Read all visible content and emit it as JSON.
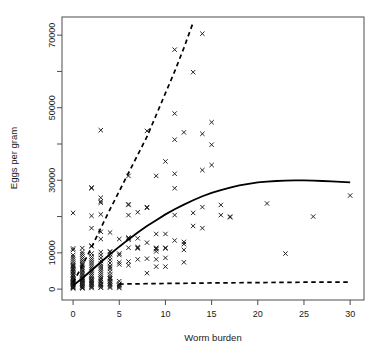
{
  "chart_data": {
    "type": "scatter",
    "title": "",
    "xlabel": "Worm burden",
    "ylabel": "Eggs per gram",
    "xlim": [
      -1.2,
      31.5
    ],
    "ylim": [
      -3000,
      75000
    ],
    "grid": false,
    "legend": "none",
    "marker": "x-cross",
    "xticks": [
      0,
      5,
      10,
      15,
      20,
      25,
      30
    ],
    "xtick_labels": [
      "0",
      "5",
      "10",
      "15",
      "20",
      "25",
      "30"
    ],
    "yticks": [
      0,
      10000,
      20000,
      30000,
      40000,
      50000,
      60000,
      70000
    ],
    "ytick_labels": [
      "0",
      "10000",
      "",
      "30000",
      "",
      "50000",
      "",
      "70000"
    ],
    "ytick_labeled": [
      0,
      10000,
      30000,
      50000,
      70000
    ],
    "points": [
      [
        0,
        200
      ],
      [
        0,
        400
      ],
      [
        0,
        600
      ],
      [
        0,
        800
      ],
      [
        0,
        1000
      ],
      [
        0,
        1200
      ],
      [
        0,
        1400
      ],
      [
        0,
        1600
      ],
      [
        0,
        1800
      ],
      [
        0,
        2000
      ],
      [
        0,
        2200
      ],
      [
        0,
        2400
      ],
      [
        0,
        2600
      ],
      [
        0,
        3000
      ],
      [
        0,
        3400
      ],
      [
        0,
        3800
      ],
      [
        0,
        4200
      ],
      [
        0,
        4600
      ],
      [
        0,
        5000
      ],
      [
        0,
        5400
      ],
      [
        0,
        5800
      ],
      [
        0,
        6200
      ],
      [
        0,
        6600
      ],
      [
        0,
        7000
      ],
      [
        0,
        7600
      ],
      [
        0,
        8200
      ],
      [
        0,
        8800
      ],
      [
        0,
        9400
      ],
      [
        0,
        10800
      ],
      [
        0,
        11200
      ],
      [
        0,
        21000
      ],
      [
        0,
        300
      ],
      [
        0,
        900
      ],
      [
        0,
        1500
      ],
      [
        0,
        2100
      ],
      [
        0,
        2700
      ],
      [
        0,
        3300
      ],
      [
        0,
        4000
      ],
      [
        0,
        4800
      ],
      [
        0,
        5600
      ],
      [
        0,
        6400
      ],
      [
        1,
        200
      ],
      [
        1,
        500
      ],
      [
        1,
        800
      ],
      [
        1,
        1100
      ],
      [
        1,
        1400
      ],
      [
        1,
        1700
      ],
      [
        1,
        2000
      ],
      [
        1,
        2300
      ],
      [
        1,
        2600
      ],
      [
        1,
        2900
      ],
      [
        1,
        3200
      ],
      [
        1,
        3600
      ],
      [
        1,
        4000
      ],
      [
        1,
        4400
      ],
      [
        1,
        4800
      ],
      [
        1,
        5200
      ],
      [
        1,
        5600
      ],
      [
        1,
        6000
      ],
      [
        1,
        6600
      ],
      [
        1,
        7200
      ],
      [
        1,
        7800
      ],
      [
        1,
        8400
      ],
      [
        1,
        9000
      ],
      [
        1,
        9600
      ],
      [
        1,
        10200
      ],
      [
        1,
        11300
      ],
      [
        1,
        6800
      ],
      [
        1,
        400
      ],
      [
        1,
        1000
      ],
      [
        1,
        1600
      ],
      [
        1,
        2200
      ],
      [
        1,
        2800
      ],
      [
        2,
        300
      ],
      [
        2,
        700
      ],
      [
        2,
        1100
      ],
      [
        2,
        1500
      ],
      [
        2,
        1900
      ],
      [
        2,
        2300
      ],
      [
        2,
        2700
      ],
      [
        2,
        3100
      ],
      [
        2,
        3500
      ],
      [
        2,
        4000
      ],
      [
        2,
        4500
      ],
      [
        2,
        5000
      ],
      [
        2,
        5500
      ],
      [
        2,
        6000
      ],
      [
        2,
        6600
      ],
      [
        2,
        7200
      ],
      [
        2,
        7800
      ],
      [
        2,
        8400
      ],
      [
        2,
        9000
      ],
      [
        2,
        9800
      ],
      [
        2,
        11800
      ],
      [
        2,
        12000
      ],
      [
        2,
        16800
      ],
      [
        2,
        20200
      ],
      [
        2,
        27800
      ],
      [
        2,
        28000
      ],
      [
        2,
        600
      ],
      [
        2,
        1300
      ],
      [
        2,
        2000
      ],
      [
        2,
        2600
      ],
      [
        3,
        400
      ],
      [
        3,
        900
      ],
      [
        3,
        1400
      ],
      [
        3,
        1900
      ],
      [
        3,
        2400
      ],
      [
        3,
        2900
      ],
      [
        3,
        3400
      ],
      [
        3,
        4000
      ],
      [
        3,
        4600
      ],
      [
        3,
        5200
      ],
      [
        3,
        5800
      ],
      [
        3,
        6400
      ],
      [
        3,
        7000
      ],
      [
        3,
        7800
      ],
      [
        3,
        8600
      ],
      [
        3,
        9400
      ],
      [
        3,
        10200
      ],
      [
        3,
        13800
      ],
      [
        3,
        15800
      ],
      [
        3,
        20600
      ],
      [
        3,
        23800
      ],
      [
        3,
        24200
      ],
      [
        3,
        25200
      ],
      [
        3,
        43800
      ],
      [
        3,
        500
      ],
      [
        3,
        1200
      ],
      [
        3,
        2000
      ],
      [
        3,
        2800
      ],
      [
        4,
        400
      ],
      [
        4,
        1000
      ],
      [
        4,
        1600
      ],
      [
        4,
        2200
      ],
      [
        4,
        2800
      ],
      [
        4,
        3400
      ],
      [
        4,
        4000
      ],
      [
        4,
        4800
      ],
      [
        4,
        5600
      ],
      [
        4,
        6400
      ],
      [
        4,
        7200
      ],
      [
        4,
        8000
      ],
      [
        4,
        8800
      ],
      [
        4,
        9600
      ],
      [
        4,
        10200
      ],
      [
        4,
        10400
      ],
      [
        4,
        15600
      ],
      [
        4,
        700
      ],
      [
        4,
        1400
      ],
      [
        4,
        2100
      ],
      [
        4,
        3000
      ],
      [
        4,
        6000
      ],
      [
        5,
        300
      ],
      [
        5,
        900
      ],
      [
        5,
        1500
      ],
      [
        5,
        2200
      ],
      [
        5,
        6800
      ],
      [
        5,
        7400
      ],
      [
        5,
        9400
      ],
      [
        5,
        9800
      ],
      [
        5,
        13800
      ],
      [
        5,
        600
      ],
      [
        5,
        1200
      ],
      [
        6,
        6600
      ],
      [
        6,
        7600
      ],
      [
        6,
        11400
      ],
      [
        6,
        13600
      ],
      [
        6,
        14000
      ],
      [
        6,
        14200
      ],
      [
        6,
        20400
      ],
      [
        6,
        23200
      ],
      [
        6,
        23400
      ],
      [
        6,
        31200
      ],
      [
        7,
        8200
      ],
      [
        7,
        11200
      ],
      [
        7,
        11400
      ],
      [
        7,
        11600
      ],
      [
        7,
        14000
      ],
      [
        7,
        21200
      ],
      [
        8,
        4400
      ],
      [
        8,
        8400
      ],
      [
        8,
        12800
      ],
      [
        8,
        22400
      ],
      [
        8,
        22600
      ],
      [
        8,
        43600
      ],
      [
        9,
        6200
      ],
      [
        9,
        8200
      ],
      [
        9,
        10400
      ],
      [
        9,
        11000
      ],
      [
        9,
        11200
      ],
      [
        9,
        11400
      ],
      [
        9,
        15200
      ],
      [
        9,
        31200
      ],
      [
        10,
        6200
      ],
      [
        10,
        8600
      ],
      [
        10,
        11200
      ],
      [
        10,
        11400
      ],
      [
        10,
        15200
      ],
      [
        10,
        35200
      ],
      [
        11,
        13400
      ],
      [
        11,
        20400
      ],
      [
        11,
        27800
      ],
      [
        11,
        31800
      ],
      [
        11,
        41200
      ],
      [
        11,
        48400
      ],
      [
        11,
        66000
      ],
      [
        12,
        7400
      ],
      [
        12,
        10800
      ],
      [
        12,
        12400
      ],
      [
        12,
        13000
      ],
      [
        12,
        43200
      ],
      [
        13,
        17400
      ],
      [
        13,
        21000
      ],
      [
        13,
        59800
      ],
      [
        14,
        16800
      ],
      [
        14,
        22600
      ],
      [
        14,
        32800
      ],
      [
        14,
        42800
      ],
      [
        14,
        70400
      ],
      [
        15,
        34200
      ],
      [
        15,
        39800
      ],
      [
        15,
        46000
      ],
      [
        16,
        20400
      ],
      [
        16,
        23200
      ],
      [
        17,
        19800
      ],
      [
        17,
        20000
      ],
      [
        21,
        23600
      ],
      [
        23,
        9800
      ],
      [
        26,
        20000
      ],
      [
        30,
        25800
      ]
    ],
    "curves": [
      {
        "name": "fitted-mean-curve",
        "style": "solid",
        "description": "Saturating fitted curve rising from origin, plateau near 30000 around worm burden 25",
        "x": [
          0,
          1,
          2,
          3,
          4,
          5,
          6,
          7,
          8,
          9,
          10,
          11,
          12,
          13,
          14,
          15,
          16,
          17,
          18,
          19,
          20,
          21,
          22,
          23,
          24,
          25,
          26,
          27,
          28,
          29,
          30
        ],
        "y": [
          1000,
          3000,
          5200,
          7400,
          9600,
          11700,
          13700,
          15600,
          17400,
          19000,
          20600,
          22000,
          23300,
          24500,
          25600,
          26500,
          27300,
          28000,
          28600,
          29000,
          29400,
          29600,
          29800,
          29900,
          29950,
          29950,
          29900,
          29800,
          29700,
          29550,
          29400
        ]
      },
      {
        "name": "upper-confidence-curve",
        "style": "dashed",
        "description": "Steep upper dashed bound exiting top of plot near worm burden 13",
        "x": [
          0,
          1,
          2,
          3,
          4,
          5,
          6,
          7,
          8,
          9,
          10,
          11,
          12,
          13
        ],
        "y": [
          1800,
          6500,
          11500,
          16800,
          22000,
          27000,
          32000,
          37000,
          42000,
          48000,
          54000,
          60000,
          66500,
          73500
        ]
      },
      {
        "name": "lower-confidence-curve",
        "style": "dashed",
        "description": "Nearly flat lower dashed bound just above zero",
        "x": [
          5,
          10,
          15,
          20,
          25,
          30
        ],
        "y": [
          1400,
          1550,
          1700,
          1800,
          1900,
          1950
        ]
      }
    ]
  },
  "axes": {
    "x_title": "Worm burden",
    "y_title": "Eggs per gram"
  }
}
